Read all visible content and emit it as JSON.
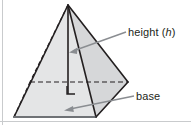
{
  "figure": {
    "background_color": "#ffffff",
    "stroke_color": "#231f20",
    "face_light_fill": "#e9eaeb",
    "face_mid_fill": "#dcdddf",
    "face_dark_fill": "#d2d3d5",
    "leader_color": "#7f8286",
    "border_color": "#c9cbcd"
  },
  "labels": {
    "height": {
      "text": "height",
      "variable_open": " (",
      "variable": "h",
      "variable_close": ")",
      "full": "height (h)"
    },
    "base": {
      "text": "base"
    }
  },
  "geometry": {
    "apex": [
      68,
      5
    ],
    "base_left": [
      14,
      117
    ],
    "base_front": [
      96,
      117
    ],
    "base_right": [
      128,
      82
    ],
    "base_back": [
      30,
      82
    ],
    "height_foot": [
      68,
      93
    ],
    "right_angle_marker": [
      67,
      92,
      8,
      8
    ]
  },
  "annotations": {
    "height_leader": {
      "from": [
        126,
        32
      ],
      "to": [
        70,
        52
      ]
    },
    "base_leader": {
      "from": [
        134,
        96
      ],
      "to": [
        64,
        110
      ]
    }
  }
}
